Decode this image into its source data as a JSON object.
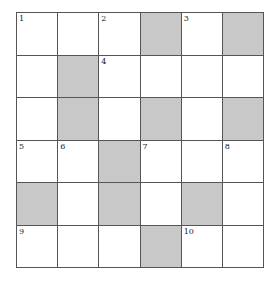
{
  "puzzle": {
    "rows": 6,
    "cols": 6,
    "block_color": "#c8c8c8",
    "cells": [
      [
        {
          "n": "1"
        },
        {
          "n": ""
        },
        {
          "n": "2"
        },
        {
          "b": true
        },
        {
          "n": "3"
        },
        {
          "b": true
        }
      ],
      [
        {
          "n": ""
        },
        {
          "b": true
        },
        {
          "n": "4"
        },
        {
          "n": ""
        },
        {
          "n": ""
        },
        {
          "n": ""
        }
      ],
      [
        {
          "n": ""
        },
        {
          "b": true
        },
        {
          "n": ""
        },
        {
          "b": true
        },
        {
          "n": ""
        },
        {
          "b": true
        }
      ],
      [
        {
          "n": "5"
        },
        {
          "n": "6"
        },
        {
          "b": true
        },
        {
          "n": "7"
        },
        {
          "n": ""
        },
        {
          "n": "8"
        }
      ],
      [
        {
          "b": true
        },
        {
          "n": ""
        },
        {
          "b": true
        },
        {
          "n": ""
        },
        {
          "b": true
        },
        {
          "n": ""
        }
      ],
      [
        {
          "n": "9"
        },
        {
          "n": ""
        },
        {
          "n": ""
        },
        {
          "b": true
        },
        {
          "n": "10"
        },
        {
          "n": ""
        }
      ]
    ]
  }
}
